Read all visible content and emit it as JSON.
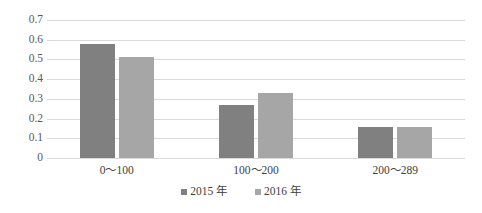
{
  "chart_data": {
    "type": "bar",
    "title": "",
    "subtitle": "",
    "xlabel": "",
    "ylabel": "",
    "categories": [
      "0～100",
      "100～200",
      "200～289"
    ],
    "series": [
      {
        "name": "2015 年",
        "color": "#808080",
        "values": [
          0.58,
          0.27,
          0.155
        ]
      },
      {
        "name": "2016 年",
        "color": "#a6a6a6",
        "values": [
          0.51,
          0.33,
          0.155
        ]
      }
    ],
    "ylim": [
      0,
      0.7
    ],
    "yticks": [
      0,
      0.1,
      0.2,
      0.3,
      0.4,
      0.5,
      0.6,
      0.7
    ],
    "ytick_labels": [
      "0",
      "0.1",
      "0.2",
      "0.3",
      "0.4",
      "0.5",
      "0.6",
      "0.7"
    ],
    "grid": true,
    "grid_axis": "y",
    "grid_color": "#d9d9d9",
    "legend": true,
    "legend_position": "bottom",
    "background": "#ffffff"
  }
}
